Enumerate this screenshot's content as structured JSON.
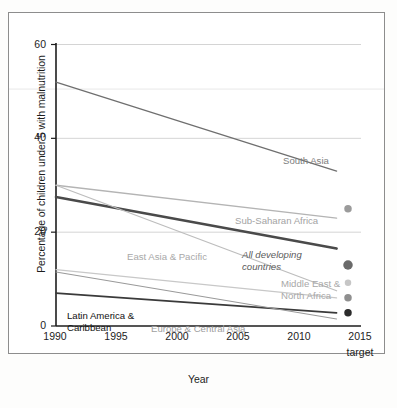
{
  "chart_data": {
    "type": "line",
    "title": "",
    "xlabel": "Year",
    "ylabel": "Percentage of children under 5 with malnutrition",
    "xlim": [
      1990,
      2015
    ],
    "ylim": [
      0,
      60
    ],
    "yticks": [
      0,
      20,
      40,
      60
    ],
    "xticks": [
      "1990",
      "1995",
      "2000",
      "2005",
      "2010",
      "2015"
    ],
    "xtick_sub": "target",
    "grid": "horizontal",
    "legend": "inline-annotations",
    "series": [
      {
        "name": "South Asia",
        "color": "#6f6f6f",
        "width": 1.3,
        "x": [
          1990,
          2013
        ],
        "values": [
          52.0,
          33.0
        ],
        "label_x": 274,
        "label_y": 142,
        "label_color": "#7d7d7d",
        "target_value": 26.0
      },
      {
        "name": "Sub-Saharan Africa",
        "color": "#b4b4b4",
        "width": 1.3,
        "x": [
          1990,
          2013
        ],
        "values": [
          30.0,
          23.0
        ],
        "label_x": 226,
        "label_y": 202,
        "label_color": "#a3a3a3",
        "target_value": 15.0
      },
      {
        "name": "All developing countries",
        "color": "#4a4a4a",
        "width": 2.6,
        "x": [
          1990,
          2013
        ],
        "values": [
          27.5,
          16.5
        ],
        "label_x": 233,
        "label_y": 236,
        "label_color": "#5b5b5b",
        "target_value": 13.8
      },
      {
        "name": "East Asia & Pacific",
        "color": "#bdbdbd",
        "width": 1.2,
        "x": [
          1990,
          2013
        ],
        "values": [
          30.0,
          7.5
        ],
        "label_x": 118,
        "label_y": 238,
        "label_color": "#a8a8a8",
        "target_value": 10.0
      },
      {
        "name": "Middle East & North Africa",
        "color": "#c8c8c8",
        "width": 1.2,
        "x": [
          1990,
          2013
        ],
        "values": [
          12.0,
          6.0
        ],
        "label_x": 272,
        "label_y": 265,
        "label_color": "#a8a8a8",
        "target_value": 6.2
      },
      {
        "name": "Latin America & Caribbean",
        "color": "#3a3a3a",
        "width": 1.6,
        "x": [
          1990,
          2013
        ],
        "values": [
          7.0,
          2.8
        ],
        "label_x": 58,
        "label_y": 297,
        "label_color": "#111111",
        "target_value": 3.5
      },
      {
        "name": "Europe & Central Asia",
        "color": "#9a9a9a",
        "width": 1.1,
        "x": [
          1990,
          2013
        ],
        "values": [
          11.5,
          1.5
        ],
        "label_x": 142,
        "label_y": 310,
        "label_color": "#a0a0a0",
        "target_value": 1.5
      }
    ],
    "target_markers": [
      {
        "name": "sub-saharan-africa-target",
        "value": 25.0,
        "color": "#9b9b9b",
        "size": 7.5
      },
      {
        "name": "south-asia-target",
        "value": 13.0,
        "color": "#6a6a6a",
        "size": 9.5
      },
      {
        "name": "east-asia-pacific-target",
        "value": 9.2,
        "color": "#c6c6c6",
        "size": 6.5
      },
      {
        "name": "middle-east-north-africa-target",
        "value": 6.0,
        "color": "#8f8f8f",
        "size": 7.5
      },
      {
        "name": "latin-america-caribbean-target",
        "value": 2.8,
        "color": "#2b2b2b",
        "size": 7.5
      }
    ]
  }
}
